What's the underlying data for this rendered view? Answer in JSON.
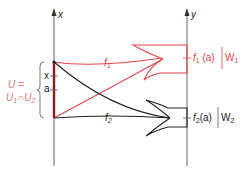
{
  "diagram": {
    "type": "mapping-diagram",
    "axes": {
      "left": {
        "label": "x"
      },
      "right": {
        "label": "y"
      }
    },
    "left_ticks": [
      {
        "label": "x"
      },
      {
        "label": "a"
      }
    ],
    "left_set_label": {
      "line1": "U =",
      "line2_a": "U",
      "line2_a_sub": "1",
      "line2_op": "∩",
      "line2_b": "U",
      "line2_b_sub": "2"
    },
    "maps": [
      {
        "name": "f",
        "sub": "1",
        "image_label": "f",
        "image_sub": "1",
        "image_arg": "(a)",
        "set_label": "W",
        "set_sub": "1",
        "color": "#e0454e"
      },
      {
        "name": "f",
        "sub": "2",
        "image_label": "f",
        "image_sub": "2",
        "image_arg": "(a)",
        "set_label": "W",
        "set_sub": "2",
        "color": "#222222"
      }
    ],
    "colors": {
      "axis": "#555555",
      "domain_segment": "#8b1a1a",
      "map1": "#e0454e",
      "map2": "#222222",
      "label_U": "#e07078"
    }
  }
}
